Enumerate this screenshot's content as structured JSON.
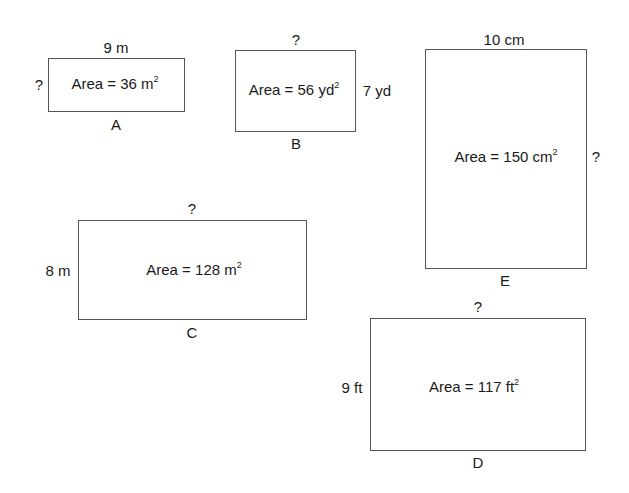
{
  "shapes": {
    "A": {
      "name": "A",
      "area_text": "Area = 36 m",
      "area_exp": "2",
      "top": "9 m",
      "left": "?"
    },
    "B": {
      "name": "B",
      "area_text": "Area = 56 yd",
      "area_exp": "2",
      "top": "?",
      "right": "7 yd"
    },
    "C": {
      "name": "C",
      "area_text": "Area = 128 m",
      "area_exp": "2",
      "top": "?",
      "left": "8 m"
    },
    "D": {
      "name": "D",
      "area_text": "Area = 117 ft",
      "area_exp": "2",
      "top": "?",
      "left": "9 ft"
    },
    "E": {
      "name": "E",
      "area_text": "Area = 150 cm",
      "area_exp": "2",
      "top": "10 cm",
      "right": "?"
    }
  }
}
